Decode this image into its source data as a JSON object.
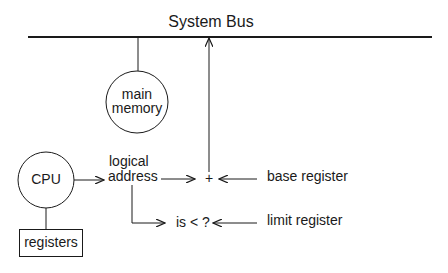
{
  "diagram": {
    "title": "System Bus",
    "nodes": {
      "main_memory": {
        "line1": "main",
        "line2": "memory"
      },
      "cpu": {
        "label": "CPU"
      },
      "registers": {
        "label": "registers"
      },
      "logical_address": {
        "line1": "logical",
        "line2": "address"
      },
      "adder": {
        "label": "+"
      },
      "comparator": {
        "label": "is < ?"
      },
      "base_register": {
        "label": "base register"
      },
      "limit_register": {
        "label": "limit register"
      }
    },
    "edges": [
      {
        "from": "main_memory",
        "to": "system_bus"
      },
      {
        "from": "cpu",
        "to": "logical_address"
      },
      {
        "from": "cpu",
        "to": "registers"
      },
      {
        "from": "logical_address",
        "to": "adder"
      },
      {
        "from": "logical_address",
        "to": "comparator"
      },
      {
        "from": "base_register",
        "to": "adder"
      },
      {
        "from": "limit_register",
        "to": "comparator"
      },
      {
        "from": "adder",
        "to": "system_bus"
      }
    ],
    "colors": {
      "stroke": "#1a1a1a",
      "background": "#ffffff"
    }
  }
}
